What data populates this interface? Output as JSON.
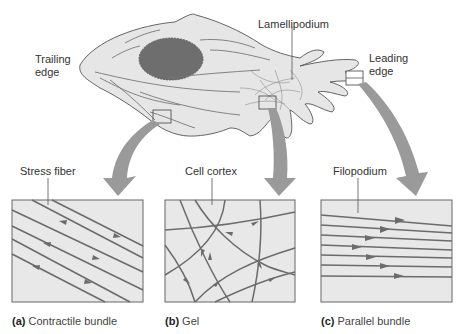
{
  "cell_labels": {
    "trailing_edge_line1": "Trailing",
    "trailing_edge_line2": "edge",
    "lamellipodium": "Lamellipodium",
    "leading_edge_line1": "Leading",
    "leading_edge_line2": "edge"
  },
  "panels": [
    {
      "pointer_label": "Stress fiber",
      "letter": "(a)",
      "caption": "Contractile bundle"
    },
    {
      "pointer_label": "Cell cortex",
      "letter": "(b)",
      "caption": "Gel"
    },
    {
      "pointer_label": "Filopodium",
      "letter": "(c)",
      "caption": "Parallel bundle"
    }
  ],
  "colors": {
    "cell_fill": "#e6e6e6",
    "nucleus": "#6e6e6e",
    "filament": "#6b6b6b",
    "panel_fill": "#e8e8e8",
    "arrow": "#9a9a9a"
  }
}
